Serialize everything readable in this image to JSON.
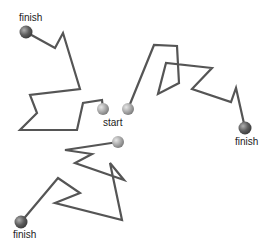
{
  "diagram": {
    "start_label": "start",
    "finish_label": "finish",
    "colors": {
      "path": "#555555",
      "start_ball": "#a0a0a0",
      "finish_ball": "#555555",
      "text": "#222222"
    },
    "labels": [
      {
        "id": "finish-top-left",
        "text": "finish",
        "x": 19,
        "y": 13
      },
      {
        "id": "start",
        "text": "start",
        "x": 103,
        "y": 118
      },
      {
        "id": "finish-right",
        "text": "finish",
        "x": 235,
        "y": 137
      },
      {
        "id": "finish-bottom-left",
        "text": "finish",
        "x": 13,
        "y": 230
      }
    ],
    "walks": [
      {
        "name": "walk-top-left",
        "start": [
          103,
          109
        ],
        "finish": [
          26,
          32
        ],
        "points": [
          [
            103,
            109
          ],
          [
            102,
            100
          ],
          [
            83,
            103
          ],
          [
            77,
            130
          ],
          [
            20,
            130
          ],
          [
            37,
            113
          ],
          [
            30,
            95
          ],
          [
            80,
            89
          ],
          [
            63,
            33
          ],
          [
            55,
            48
          ],
          [
            26,
            32
          ]
        ]
      },
      {
        "name": "walk-right",
        "start": [
          128,
          109
        ],
        "finish": [
          245,
          128
        ],
        "points": [
          [
            128,
            109
          ],
          [
            154,
            45
          ],
          [
            177,
            46
          ],
          [
            179,
            83
          ],
          [
            158,
            94
          ],
          [
            166,
            63
          ],
          [
            212,
            68
          ],
          [
            192,
            89
          ],
          [
            231,
            102
          ],
          [
            236,
            88
          ],
          [
            245,
            128
          ]
        ]
      },
      {
        "name": "walk-bottom-left",
        "start": [
          118,
          142
        ],
        "finish": [
          21,
          222
        ],
        "points": [
          [
            118,
            142
          ],
          [
            65,
            150
          ],
          [
            92,
            154
          ],
          [
            75,
            163
          ],
          [
            124,
            180
          ],
          [
            110,
            163
          ],
          [
            122,
            220
          ],
          [
            55,
            203
          ],
          [
            80,
            193
          ],
          [
            58,
            178
          ],
          [
            21,
            222
          ]
        ]
      }
    ]
  }
}
